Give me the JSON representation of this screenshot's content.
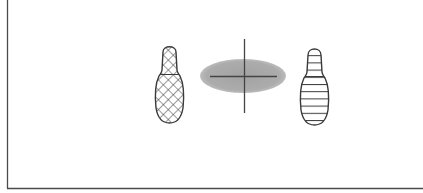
{
  "diagram": {
    "colors": {
      "background": "#ffffff",
      "frame": "#4a4a4a",
      "outline": "#3a3a3a",
      "ellipse_fill": "#a9a9a9",
      "crosshair": "#444444"
    },
    "elements": [
      {
        "id": "left-footprint",
        "pattern": "crosshatch"
      },
      {
        "id": "center-ellipse",
        "pattern": "solid-gray",
        "marker": "crosshair"
      },
      {
        "id": "right-footprint",
        "pattern": "horizontal-stripes"
      }
    ]
  }
}
